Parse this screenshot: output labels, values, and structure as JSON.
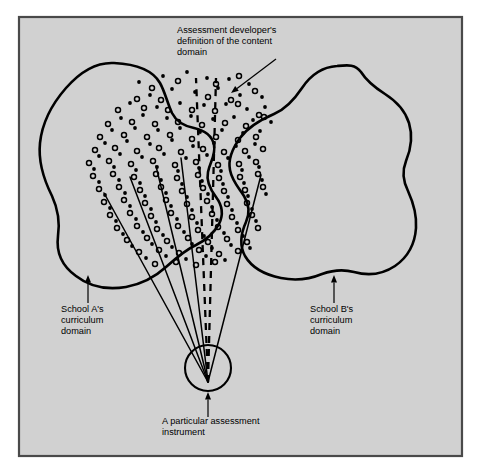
{
  "figure": {
    "kind": "conceptual-venn-diagram",
    "background_color": "#d4d4d4",
    "page_color": "#ffffff",
    "frame_border_color": "#4a4a4a",
    "ink_color": "#000000",
    "frame": {
      "x": 19,
      "y": 17,
      "width": 443,
      "height": 439
    }
  },
  "labels": {
    "content_domain": {
      "name": "assessment-developer-definition",
      "lines": [
        "Assessment developer's",
        "definition of the content",
        "domain"
      ],
      "text_anchor": {
        "x": 177,
        "y": 33
      },
      "arrow": {
        "from_x": 276,
        "from_y": 59,
        "to_x": 231,
        "to_y": 93
      }
    },
    "school_a": {
      "name": "school-a-curriculum-domain",
      "lines": [
        "School A's",
        "curriculum",
        "domain"
      ],
      "text_anchor": {
        "x": 61,
        "y": 312
      },
      "arrow": {
        "from_x": 88,
        "from_y": 303,
        "to_x": 88,
        "to_y": 275
      }
    },
    "school_b": {
      "name": "school-b-curriculum-domain",
      "lines": [
        "School B's",
        "curriculum",
        "domain"
      ],
      "text_anchor": {
        "x": 310,
        "y": 312
      },
      "arrow": {
        "from_x": 334,
        "from_y": 303,
        "to_x": 334,
        "to_y": 275
      }
    },
    "instrument": {
      "name": "particular-assessment-instrument",
      "lines": [
        "A particular assessment",
        "instrument"
      ],
      "text_anchor": {
        "x": 162,
        "y": 424
      },
      "arrow": {
        "from_x": 208,
        "from_y": 417,
        "to_x": 208,
        "to_y": 392
      }
    }
  },
  "shapes": {
    "school_a_blob": {
      "name": "school-a-blob",
      "stroke_width": 2.6,
      "path": "M 114 63 C 96 62 80 72 66 88 C 52 104 42 124 40 143 C 38 162 44 180 52 196 C 58 209 60 222 58 236 C 56 252 62 266 76 276 C 90 287 108 290 126 287 C 142 284 155 277 166 267 C 176 258 185 250 196 245 C 206 240 214 233 219 224 C 224 214 222 205 216 197 C 210 189 206 181 208 172 C 210 162 216 155 214 145 C 212 135 203 130 194 128 C 184 126 176 121 172 113 C 167 102 165 92 160 83 C 152 69 134 64 114 63 Z"
    },
    "school_b_blob": {
      "name": "school-b-blob",
      "stroke_width": 2.6,
      "path": "M 337 66 C 322 67 310 76 302 88 C 294 100 286 109 274 114 C 260 120 248 127 240 138 C 232 149 228 160 230 170 C 232 181 239 188 244 196 C 249 204 250 213 246 222 C 241 233 239 245 245 256 C 252 268 266 275 281 278 C 296 281 310 279 322 274 C 333 270 343 269 354 272 C 368 276 383 274 395 266 C 408 257 415 243 416 228 C 417 214 413 202 408 191 C 403 181 402 171 406 161 C 411 149 413 136 409 123 C 405 110 396 101 385 94 C 374 87 366 80 361 72 C 355 64 348 65 337 66 Z"
    },
    "instrument_circle": {
      "name": "assessment-instrument-circle",
      "cx": 208,
      "cy": 368,
      "r": 23,
      "stroke_width": 2.1
    }
  },
  "rays": {
    "name": "assessment-item-rays",
    "origin": {
      "x": 208,
      "y": 382
    },
    "stroke_width": 1.5,
    "solid": [
      {
        "x2": 104,
        "y2": 193
      },
      {
        "x2": 130,
        "y2": 177
      },
      {
        "x2": 156,
        "y2": 166
      },
      {
        "x2": 181,
        "y2": 158
      },
      {
        "x2": 261,
        "y2": 175
      }
    ],
    "dashed": [
      {
        "x2": 196,
        "y2": 78
      },
      {
        "x2": 216,
        "y2": 78
      }
    ],
    "dash_pattern": "7 6"
  },
  "dot_field": {
    "name": "content-domain-dot-field",
    "filled_color": "#000000",
    "open_stroke_color": "#000000",
    "filled_radius": 1.9,
    "open_radius": 2.5,
    "filled": [
      [
        139,
        82
      ],
      [
        163,
        76
      ],
      [
        187,
        72
      ],
      [
        207,
        78
      ],
      [
        229,
        79
      ],
      [
        249,
        84
      ],
      [
        150,
        95
      ],
      [
        172,
        89
      ],
      [
        195,
        92
      ],
      [
        218,
        88
      ],
      [
        240,
        95
      ],
      [
        262,
        97
      ],
      [
        130,
        103
      ],
      [
        157,
        107
      ],
      [
        180,
        103
      ],
      [
        204,
        105
      ],
      [
        226,
        104
      ],
      [
        247,
        109
      ],
      [
        265,
        107
      ],
      [
        121,
        118
      ],
      [
        143,
        115
      ],
      [
        167,
        118
      ],
      [
        191,
        116
      ],
      [
        213,
        119
      ],
      [
        234,
        117
      ],
      [
        253,
        120
      ],
      [
        271,
        122
      ],
      [
        112,
        130
      ],
      [
        135,
        128
      ],
      [
        158,
        130
      ],
      [
        180,
        128
      ],
      [
        200,
        132
      ],
      [
        222,
        130
      ],
      [
        243,
        133
      ],
      [
        260,
        131
      ],
      [
        105,
        143
      ],
      [
        127,
        141
      ],
      [
        150,
        144
      ],
      [
        172,
        140
      ],
      [
        193,
        146
      ],
      [
        214,
        143
      ],
      [
        236,
        146
      ],
      [
        255,
        144
      ],
      [
        99,
        156
      ],
      [
        120,
        154
      ],
      [
        142,
        157
      ],
      [
        164,
        154
      ],
      [
        186,
        158
      ],
      [
        207,
        155
      ],
      [
        228,
        158
      ],
      [
        249,
        157
      ],
      [
        94,
        169
      ],
      [
        114,
        167
      ],
      [
        136,
        170
      ],
      [
        157,
        167
      ],
      [
        178,
        171
      ],
      [
        199,
        168
      ],
      [
        221,
        171
      ],
      [
        242,
        170
      ],
      [
        259,
        167
      ],
      [
        99,
        182
      ],
      [
        119,
        180
      ],
      [
        140,
        183
      ],
      [
        161,
        180
      ],
      [
        182,
        184
      ],
      [
        202,
        181
      ],
      [
        223,
        184
      ],
      [
        244,
        183
      ],
      [
        262,
        180
      ],
      [
        105,
        195
      ],
      [
        125,
        193
      ],
      [
        145,
        196
      ],
      [
        166,
        193
      ],
      [
        187,
        197
      ],
      [
        208,
        194
      ],
      [
        228,
        197
      ],
      [
        248,
        196
      ],
      [
        266,
        194
      ],
      [
        110,
        208
      ],
      [
        130,
        206
      ],
      [
        151,
        209
      ],
      [
        171,
        206
      ],
      [
        192,
        210
      ],
      [
        212,
        207
      ],
      [
        232,
        210
      ],
      [
        252,
        209
      ],
      [
        116,
        221
      ],
      [
        136,
        219
      ],
      [
        156,
        222
      ],
      [
        177,
        219
      ],
      [
        197,
        223
      ],
      [
        217,
        220
      ],
      [
        237,
        223
      ],
      [
        256,
        221
      ],
      [
        123,
        234
      ],
      [
        143,
        232
      ],
      [
        163,
        235
      ],
      [
        184,
        232
      ],
      [
        204,
        236
      ],
      [
        224,
        233
      ],
      [
        243,
        236
      ],
      [
        132,
        246
      ],
      [
        152,
        244
      ],
      [
        172,
        247
      ],
      [
        192,
        244
      ],
      [
        212,
        248
      ],
      [
        231,
        245
      ],
      [
        250,
        248
      ],
      [
        146,
        258
      ],
      [
        166,
        256
      ],
      [
        186,
        259
      ],
      [
        206,
        256
      ],
      [
        225,
        260
      ]
    ],
    "open": [
      [
        152,
        88
      ],
      [
        178,
        81
      ],
      [
        216,
        84
      ],
      [
        239,
        76
      ],
      [
        137,
        99
      ],
      [
        161,
        100
      ],
      [
        208,
        97
      ],
      [
        231,
        100
      ],
      [
        255,
        91
      ],
      [
        118,
        110
      ],
      [
        144,
        108
      ],
      [
        168,
        110
      ],
      [
        192,
        110
      ],
      [
        215,
        111
      ],
      [
        238,
        104
      ],
      [
        259,
        115
      ],
      [
        108,
        124
      ],
      [
        132,
        122
      ],
      [
        155,
        124
      ],
      [
        178,
        122
      ],
      [
        202,
        125
      ],
      [
        225,
        123
      ],
      [
        246,
        126
      ],
      [
        264,
        117
      ],
      [
        100,
        137
      ],
      [
        124,
        135
      ],
      [
        147,
        137
      ],
      [
        170,
        135
      ],
      [
        192,
        139
      ],
      [
        216,
        137
      ],
      [
        238,
        140
      ],
      [
        256,
        137
      ],
      [
        95,
        150
      ],
      [
        115,
        148
      ],
      [
        137,
        151
      ],
      [
        159,
        148
      ],
      [
        181,
        152
      ],
      [
        203,
        149
      ],
      [
        224,
        152
      ],
      [
        245,
        151
      ],
      [
        263,
        149
      ],
      [
        89,
        163
      ],
      [
        109,
        161
      ],
      [
        131,
        164
      ],
      [
        153,
        161
      ],
      [
        175,
        165
      ],
      [
        196,
        162
      ],
      [
        218,
        165
      ],
      [
        239,
        164
      ],
      [
        256,
        162
      ],
      [
        93,
        176
      ],
      [
        113,
        174
      ],
      [
        134,
        177
      ],
      [
        156,
        174
      ],
      [
        177,
        178
      ],
      [
        198,
        175
      ],
      [
        219,
        178
      ],
      [
        240,
        177
      ],
      [
        258,
        174
      ],
      [
        99,
        189
      ],
      [
        119,
        187
      ],
      [
        140,
        190
      ],
      [
        161,
        187
      ],
      [
        182,
        191
      ],
      [
        203,
        188
      ],
      [
        224,
        191
      ],
      [
        245,
        190
      ],
      [
        263,
        187
      ],
      [
        104,
        202
      ],
      [
        124,
        200
      ],
      [
        145,
        203
      ],
      [
        166,
        200
      ],
      [
        187,
        204
      ],
      [
        207,
        201
      ],
      [
        227,
        204
      ],
      [
        247,
        203
      ],
      [
        110,
        215
      ],
      [
        130,
        213
      ],
      [
        151,
        216
      ],
      [
        171,
        213
      ],
      [
        192,
        217
      ],
      [
        212,
        214
      ],
      [
        232,
        217
      ],
      [
        252,
        215
      ],
      [
        117,
        228
      ],
      [
        137,
        226
      ],
      [
        157,
        229
      ],
      [
        178,
        226
      ],
      [
        198,
        230
      ],
      [
        218,
        227
      ],
      [
        238,
        230
      ],
      [
        258,
        228
      ],
      [
        127,
        240
      ],
      [
        147,
        238
      ],
      [
        167,
        241
      ],
      [
        188,
        238
      ],
      [
        208,
        242
      ],
      [
        227,
        239
      ],
      [
        247,
        242
      ],
      [
        139,
        252
      ],
      [
        159,
        250
      ],
      [
        179,
        253
      ],
      [
        199,
        250
      ],
      [
        219,
        254
      ],
      [
        238,
        251
      ],
      [
        155,
        264
      ],
      [
        176,
        262
      ],
      [
        196,
        265
      ],
      [
        215,
        262
      ]
    ]
  }
}
